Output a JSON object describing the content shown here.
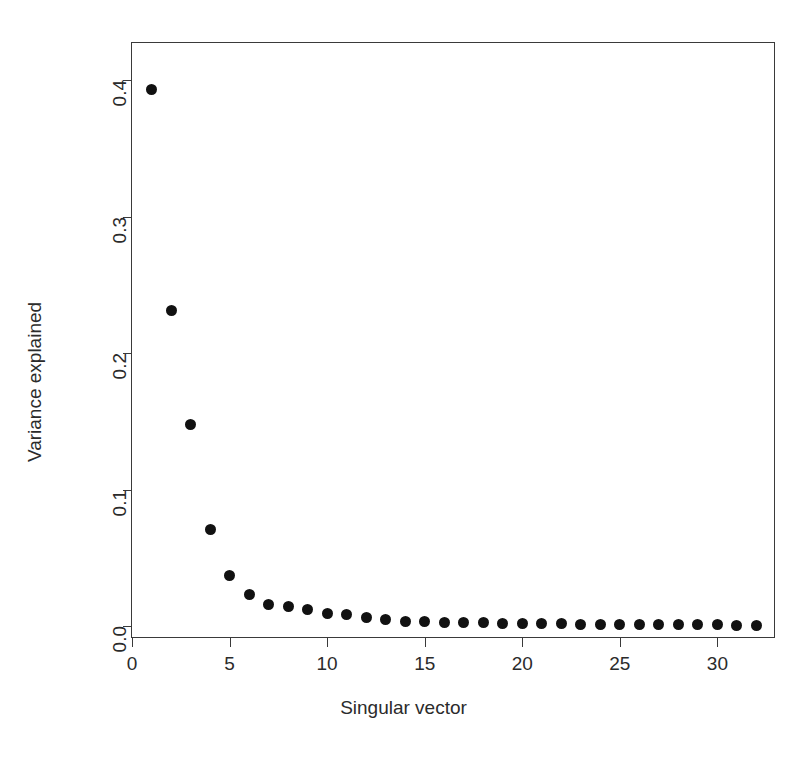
{
  "chart_data": {
    "type": "scatter",
    "title": "",
    "xlabel": "Singular vector",
    "ylabel": "Variance explained",
    "xlim": [
      0.0,
      32.9
    ],
    "ylim": [
      -0.008,
      0.4273
    ],
    "grid": false,
    "legend": null,
    "x_ticks": [
      "0",
      "5",
      "10",
      "15",
      "20",
      "25",
      "30"
    ],
    "x_tick_values": [
      0,
      5,
      10,
      15,
      20,
      25,
      30
    ],
    "y_ticks": [
      "0.0",
      "0.1",
      "0.2",
      "0.3",
      "0.4"
    ],
    "y_tick_values": [
      0.0,
      0.1,
      0.2,
      0.3,
      0.4
    ],
    "marker": "filled-circle",
    "marker_color": "#111111",
    "x": [
      1,
      2,
      3,
      4,
      5,
      6,
      7,
      8,
      9,
      10,
      11,
      12,
      13,
      14,
      15,
      16,
      17,
      18,
      19,
      20,
      21,
      22,
      23,
      24,
      25,
      26,
      27,
      28,
      29,
      30,
      31,
      32
    ],
    "values": [
      0.393,
      0.231,
      0.148,
      0.071,
      0.037,
      0.023,
      0.016,
      0.014,
      0.012,
      0.0095,
      0.0085,
      0.0065,
      0.005,
      0.0035,
      0.003,
      0.0028,
      0.0025,
      0.0023,
      0.0021,
      0.0019,
      0.0018,
      0.0016,
      0.0015,
      0.0014,
      0.0013,
      0.0012,
      0.0011,
      0.001,
      0.0009,
      0.0008,
      0.0007,
      0.0006
    ],
    "series": [
      {
        "name": "Variance explained",
        "values": [
          0.393,
          0.231,
          0.148,
          0.071,
          0.037,
          0.023,
          0.016,
          0.014,
          0.012,
          0.0095,
          0.0085,
          0.0065,
          0.005,
          0.0035,
          0.003,
          0.0028,
          0.0025,
          0.0023,
          0.0021,
          0.0019,
          0.0018,
          0.0016,
          0.0015,
          0.0014,
          0.0013,
          0.0012,
          0.0011,
          0.001,
          0.0009,
          0.0008,
          0.0007,
          0.0006
        ]
      }
    ]
  }
}
